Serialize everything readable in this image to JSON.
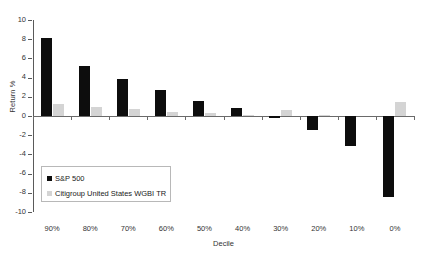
{
  "chart_data": {
    "type": "bar",
    "title": "",
    "xlabel": "Decile",
    "ylabel": "Return %",
    "categories": [
      "90%",
      "80%",
      "70%",
      "60%",
      "50%",
      "40%",
      "30%",
      "20%",
      "10%",
      "0%"
    ],
    "series": [
      {
        "name": "S&P 500",
        "color": "#0d0d0d",
        "values": [
          8.1,
          5.2,
          3.9,
          2.7,
          1.6,
          0.8,
          -0.2,
          -1.5,
          -3.1,
          -8.4
        ]
      },
      {
        "name": "Citigroup United States WGBI TR",
        "color": "#d4d4d4",
        "values": [
          1.2,
          0.9,
          0.7,
          0.45,
          0.3,
          0.15,
          0.6,
          0.15,
          0.0,
          1.5
        ]
      }
    ],
    "ylim": [
      -10,
      10
    ],
    "yticks": [
      10,
      8,
      6,
      4,
      2,
      0,
      -2,
      -4,
      -6,
      -8,
      -10
    ],
    "ytick_labels": [
      "10",
      "8",
      "6",
      "4",
      "2",
      "0",
      "-2",
      "-4",
      "-6",
      "-8",
      "-10"
    ],
    "grid": false,
    "legend_position": "inside-lower-left"
  }
}
